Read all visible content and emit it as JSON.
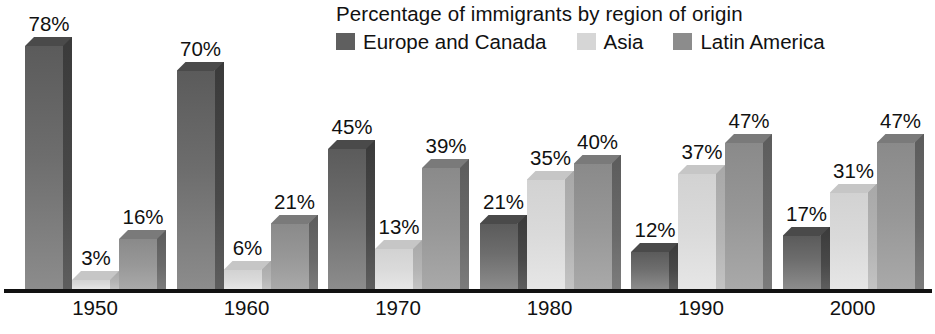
{
  "chart_data": {
    "type": "bar",
    "title": "Percentage of immigrants by region of origin",
    "xlabel": "",
    "ylabel": "",
    "ylim": [
      0,
      80
    ],
    "grid": false,
    "legend_position": "top-right",
    "value_suffix": "%",
    "categories": [
      "1950",
      "1960",
      "1970",
      "1980",
      "1990",
      "2000"
    ],
    "series": [
      {
        "name": "Europe and Canada",
        "color": "#6d6d6d",
        "values": [
          78,
          70,
          45,
          21,
          12,
          17
        ],
        "labels": [
          "78%",
          "70%",
          "45%",
          "21%",
          "12%",
          "17%"
        ]
      },
      {
        "name": "Asia",
        "color": "#dadada",
        "values": [
          3,
          6,
          13,
          35,
          37,
          31
        ],
        "labels": [
          "3%",
          "6%",
          "13%",
          "35%",
          "37%",
          "31%"
        ]
      },
      {
        "name": "Latin America",
        "color": "#979797",
        "values": [
          16,
          21,
          39,
          40,
          47,
          47
        ],
        "labels": [
          "16%",
          "21%",
          "39%",
          "40%",
          "47%",
          "47%"
        ]
      }
    ]
  },
  "legend": {
    "items": [
      {
        "label": "Europe and Canada",
        "swatch_color": "#5f5f5f"
      },
      {
        "label": "Asia",
        "swatch_color": "#d6d6d6"
      },
      {
        "label": "Latin America",
        "swatch_color": "#8c8c8c"
      }
    ]
  },
  "axis": {
    "baseline_color": "#111111"
  }
}
